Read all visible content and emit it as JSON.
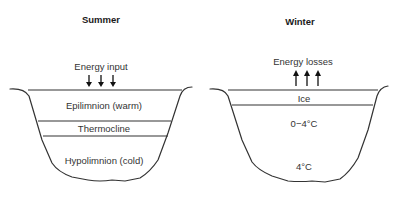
{
  "panels": {
    "summer": {
      "title": "Summer",
      "energy_label": "Energy input",
      "energy_direction": "down",
      "layers": [
        {
          "name": "Epilimnion (warm)"
        },
        {
          "name": "Thermocline"
        },
        {
          "name": "Hypolimnion (cold)"
        }
      ]
    },
    "winter": {
      "title": "Winter",
      "energy_label": "Energy losses",
      "energy_direction": "up",
      "layers": [
        {
          "name": "Ice"
        },
        {
          "name": "0−4°C"
        },
        {
          "name": "4°C"
        }
      ]
    }
  },
  "colors": {
    "line": "#333333",
    "text": "#333333",
    "background": "#ffffff"
  }
}
